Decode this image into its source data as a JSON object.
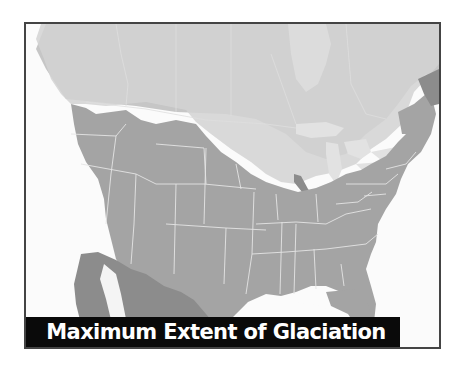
{
  "map": {
    "title": "Maximum Extent of Glaciation",
    "region": "North America (United States, southern Canada, northern Mexico)",
    "legend_colors": {
      "ocean": "#fbfbfb",
      "glaciated": "#d2d2d2",
      "canada_land": "#c6c6c6",
      "unglaciated_us": "#a4a4a4",
      "mexico": "#8c8c8c",
      "state_border": "#e4e4e4",
      "frame_border": "#444444",
      "title_bg": "#0a0a0a",
      "title_text": "#ffffff"
    }
  }
}
